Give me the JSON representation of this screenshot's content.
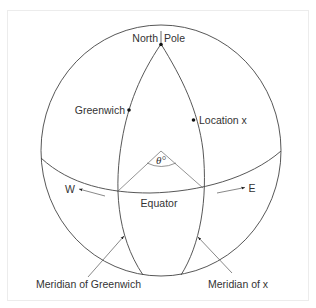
{
  "diagram": {
    "labels": {
      "north_pole_left": "North",
      "north_pole_right": "Pole",
      "greenwich": "Greenwich",
      "location_x": "Location x",
      "angle": "θ°",
      "west": "W",
      "east": "E",
      "equator": "Equator",
      "meridian_greenwich": "Meridian of Greenwich",
      "meridian_x": "Meridian of x"
    },
    "colors": {
      "line": "#333333",
      "thin_line": "#555555",
      "frame": "#ececec",
      "background": "#ffffff"
    }
  }
}
